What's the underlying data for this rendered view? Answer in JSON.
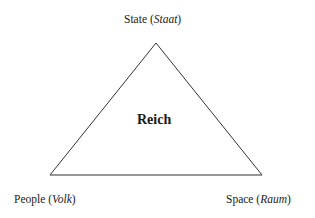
{
  "diagram": {
    "type": "triangle",
    "center_label": "Reich",
    "vertices": [
      {
        "position": "top",
        "label": "State",
        "german": "Staat"
      },
      {
        "position": "bottom-left",
        "label": "People",
        "german": "Volk"
      },
      {
        "position": "bottom-right",
        "label": "Space",
        "german": "Raum"
      }
    ]
  }
}
